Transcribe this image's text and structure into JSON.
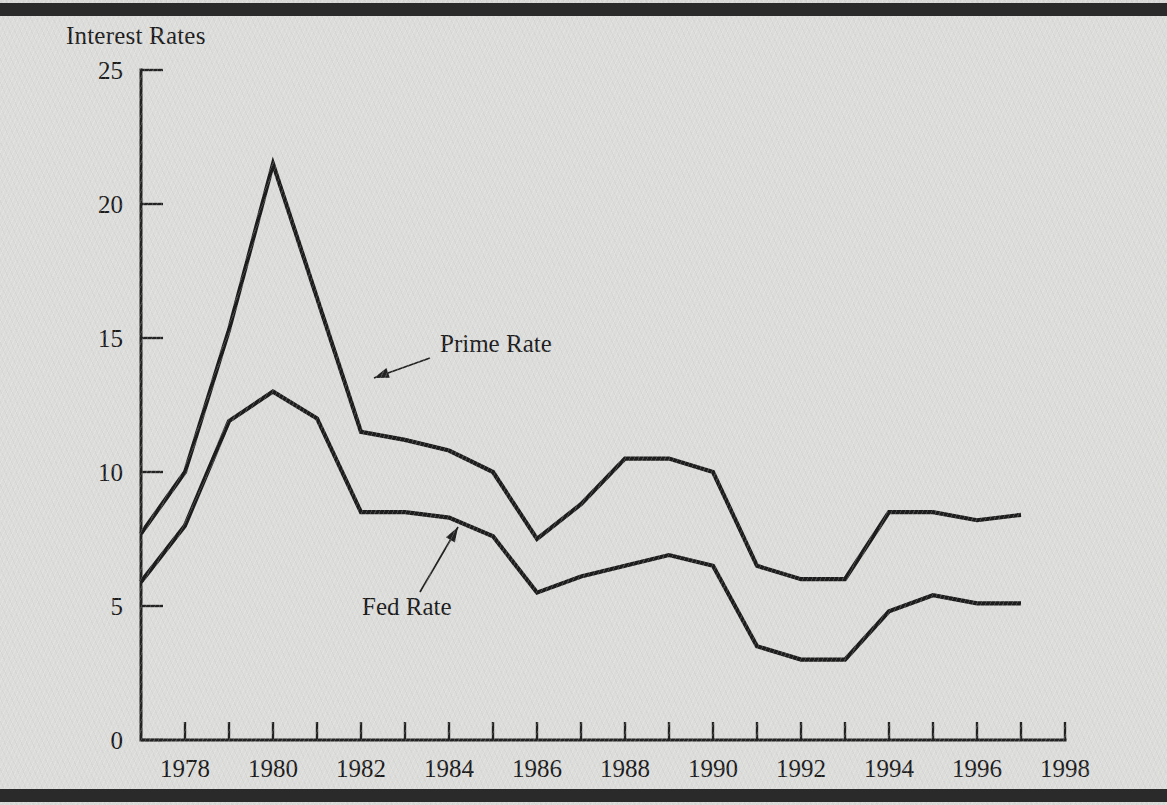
{
  "figure": {
    "title": "Interest Rates",
    "background_color": "#dcdcda",
    "ink_color": "#1d1d1d",
    "edge_bar_color": "#2a2a2a"
  },
  "chart_data": {
    "type": "line",
    "title": "Interest Rates",
    "xlabel": "",
    "ylabel": "Interest Rates",
    "xlim": [
      1977,
      1998
    ],
    "ylim": [
      0,
      25
    ],
    "grid": false,
    "legend": "inline-annotations",
    "x_tick_labels": [
      "1978",
      "1980",
      "1982",
      "1984",
      "1986",
      "1988",
      "1990",
      "1992",
      "1994",
      "1996",
      "1998"
    ],
    "x_tick_values": [
      1978,
      1980,
      1982,
      1984,
      1986,
      1988,
      1990,
      1992,
      1994,
      1996,
      1998
    ],
    "x_minor_ticks": [
      1977,
      1979,
      1981,
      1983,
      1985,
      1987,
      1989,
      1991,
      1993,
      1995,
      1997
    ],
    "y_tick_labels": [
      "0",
      "5",
      "10",
      "15",
      "20",
      "25"
    ],
    "y_tick_values": [
      0,
      5,
      10,
      15,
      20,
      25
    ],
    "x": [
      1977,
      1978,
      1979,
      1980,
      1981,
      1982,
      1983,
      1984,
      1985,
      1986,
      1987,
      1988,
      1989,
      1990,
      1991,
      1992,
      1993,
      1994,
      1995,
      1996,
      1997
    ],
    "series": [
      {
        "name": "Prime Rate",
        "values": [
          7.7,
          10.0,
          15.3,
          21.5,
          16.5,
          11.5,
          11.2,
          10.8,
          10.0,
          7.5,
          8.8,
          10.5,
          10.5,
          10.0,
          6.5,
          6.0,
          6.0,
          8.5,
          8.5,
          8.2,
          8.4
        ]
      },
      {
        "name": "Fed Rate",
        "values": [
          5.9,
          8.0,
          11.9,
          13.0,
          12.0,
          8.5,
          8.5,
          8.3,
          7.6,
          5.5,
          6.1,
          6.5,
          6.9,
          6.5,
          3.5,
          3.0,
          3.0,
          4.8,
          5.4,
          5.1,
          5.1
        ]
      }
    ],
    "annotations": [
      {
        "label": "Prime Rate",
        "label_x": 440,
        "label_y": 352,
        "leader_from_x": 430,
        "leader_from_y": 358,
        "leader_to_x": 374,
        "leader_to_y": 378,
        "arrow_direction": "down-left"
      },
      {
        "label": "Fed Rate",
        "label_x": 362,
        "label_y": 615,
        "leader_from_x": 420,
        "leader_from_y": 592,
        "leader_to_x": 458,
        "leader_to_y": 527,
        "arrow_direction": "up-right"
      }
    ]
  }
}
